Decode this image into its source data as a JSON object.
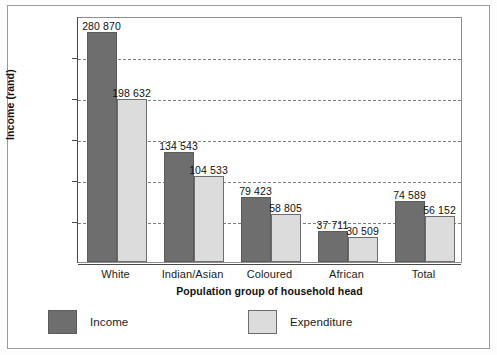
{
  "chart_data": {
    "type": "bar",
    "title": "",
    "subtitle": "",
    "xlabel": "Population group of household head",
    "ylabel": "Income (rand)",
    "ylim": [
      0,
      300000
    ],
    "yticks": [
      0,
      50000,
      100000,
      150000,
      200000,
      250000,
      300000
    ],
    "ytick_labels": [
      "0",
      "50 000",
      "100 000",
      "150 000",
      "200 000",
      "250 000",
      "300 000"
    ],
    "grid": "horizontal-dashed",
    "legend_position": "bottom",
    "categories": [
      "White",
      "Indian/Asian",
      "Coloured",
      "African",
      "Total"
    ],
    "series": [
      {
        "name": "Income",
        "color": "#6e6e6e",
        "values": [
          280870,
          134543,
          79423,
          37711,
          74589
        ],
        "labels": [
          "280 870",
          "134 543",
          "79 423",
          "37 711",
          "74 589"
        ]
      },
      {
        "name": "Expenditure",
        "color": "#dcdcdc",
        "values": [
          198632,
          104533,
          58805,
          30509,
          56152
        ],
        "labels": [
          "198 632",
          "104 533",
          "58 805",
          "30 509",
          "56 152"
        ]
      }
    ]
  },
  "legend": {
    "income_label": "Income",
    "expenditure_label": "Expenditure"
  },
  "colors": {
    "income": "#6e6e6e",
    "expenditure": "#dcdcdc",
    "axis": "#4a4a4a",
    "grid": "#7d7d7d",
    "frame": "#9a9a9a",
    "text": "#1b1b1b"
  }
}
